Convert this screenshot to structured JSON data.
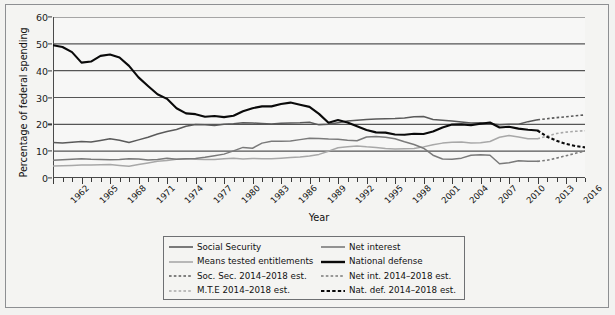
{
  "chart_data": {
    "type": "line",
    "title": "",
    "xlabel": "Year",
    "ylabel": "Percentage of federal spending",
    "xlim": [
      1962,
      2018
    ],
    "ylim": [
      0,
      60
    ],
    "ytick_values": [
      0,
      10,
      20,
      30,
      40,
      50,
      60
    ],
    "ytick_labels": [
      "0",
      "10",
      "20",
      "30",
      "40",
      "50",
      "60"
    ],
    "xtick_labels": [
      "1962",
      "1965",
      "1968",
      "1971",
      "1974",
      "1977",
      "1980",
      "1983",
      "1986",
      "1989",
      "1992",
      "1995",
      "1998",
      "2001",
      "2004",
      "2007",
      "2010",
      "2013",
      "2016"
    ],
    "xtick_values": [
      1962,
      1965,
      1968,
      1971,
      1974,
      1977,
      1980,
      1983,
      1986,
      1989,
      1992,
      1995,
      1998,
      2001,
      2004,
      2007,
      2010,
      2013,
      2016
    ],
    "x_minor_step": 1,
    "grid": "horizontal",
    "legend_position": "below-center",
    "x": [
      1962,
      1963,
      1964,
      1965,
      1966,
      1967,
      1968,
      1969,
      1970,
      1971,
      1972,
      1973,
      1974,
      1975,
      1976,
      1977,
      1978,
      1979,
      1980,
      1981,
      1982,
      1983,
      1984,
      1985,
      1986,
      1987,
      1988,
      1989,
      1990,
      1991,
      1992,
      1993,
      1994,
      1995,
      1996,
      1997,
      1998,
      1999,
      2000,
      2001,
      2002,
      2003,
      2004,
      2005,
      2006,
      2007,
      2008,
      2009,
      2010,
      2011,
      2012,
      2013
    ],
    "x_est": [
      2013,
      2014,
      2015,
      2016,
      2017,
      2018
    ],
    "series": [
      {
        "name": "Social Security",
        "color": "#5a5a5a",
        "style": "solid",
        "width": 1.5,
        "values": [
          13.2,
          13.0,
          13.3,
          13.6,
          13.4,
          14.0,
          14.6,
          14.1,
          13.2,
          14.2,
          15.2,
          16.4,
          17.3,
          18.1,
          19.3,
          19.9,
          19.8,
          19.6,
          20.0,
          20.2,
          20.6,
          20.5,
          20.3,
          20.1,
          20.4,
          20.5,
          20.6,
          20.8,
          19.8,
          20.0,
          20.6,
          21.2,
          21.5,
          21.8,
          22.0,
          22.1,
          22.2,
          22.4,
          22.8,
          22.9,
          21.8,
          21.5,
          21.2,
          20.9,
          20.5,
          20.6,
          20.2,
          19.8,
          20.0,
          20.0,
          21.0,
          21.7
        ]
      },
      {
        "name": "Means tested entitlements",
        "color": "#a8a8a8",
        "style": "solid",
        "width": 1.5,
        "values": [
          4.5,
          4.6,
          4.7,
          4.8,
          4.8,
          4.9,
          5.0,
          4.7,
          4.4,
          5.0,
          5.6,
          6.2,
          6.5,
          7.0,
          7.2,
          7.0,
          6.9,
          6.9,
          7.2,
          7.4,
          7.1,
          7.3,
          7.2,
          7.2,
          7.4,
          7.6,
          7.8,
          8.2,
          8.8,
          10.0,
          11.3,
          11.6,
          11.9,
          11.6,
          11.4,
          11.0,
          10.8,
          10.9,
          11.0,
          11.6,
          12.4,
          13.0,
          13.3,
          13.4,
          13.0,
          13.1,
          13.6,
          15.2,
          15.8,
          15.3,
          14.6,
          14.6
        ]
      },
      {
        "name": "Net interest",
        "color": "#7a7a7a",
        "style": "solid",
        "width": 1.5,
        "values": [
          6.6,
          6.8,
          7.0,
          7.2,
          7.0,
          6.9,
          6.8,
          6.9,
          7.2,
          7.1,
          6.7,
          6.9,
          7.4,
          7.0,
          7.2,
          7.3,
          7.7,
          8.3,
          8.9,
          10.1,
          11.4,
          11.1,
          13.0,
          13.7,
          13.7,
          13.8,
          14.3,
          14.8,
          14.7,
          14.5,
          14.4,
          14.1,
          13.9,
          15.3,
          15.5,
          15.2,
          14.6,
          13.5,
          12.5,
          11.1,
          8.5,
          7.1,
          7.0,
          7.4,
          8.5,
          8.7,
          8.5,
          5.3,
          5.7,
          6.4,
          6.2,
          6.2
        ]
      },
      {
        "name": "National defense",
        "color": "#0a0a0a",
        "style": "solid",
        "width": 2.1,
        "values": [
          49.5,
          48.8,
          46.9,
          43.0,
          43.4,
          45.5,
          46.0,
          44.9,
          41.8,
          37.5,
          34.3,
          31.2,
          29.5,
          26.0,
          24.1,
          23.8,
          22.8,
          23.1,
          22.7,
          23.2,
          24.9,
          26.0,
          26.7,
          26.7,
          27.6,
          28.1,
          27.3,
          26.5,
          23.9,
          20.6,
          21.6,
          20.7,
          19.3,
          17.9,
          17.0,
          16.9,
          16.2,
          16.1,
          16.5,
          16.4,
          17.3,
          18.8,
          19.9,
          20.0,
          19.7,
          20.2,
          20.7,
          18.8,
          19.1,
          18.4,
          18.0,
          17.7
        ]
      }
    ],
    "series_est": [
      {
        "name": "Soc. Sec. 2014–2018 est.",
        "color": "#5a5a5a",
        "style": "dashed",
        "width": 1.6,
        "values": [
          21.7,
          22.1,
          22.5,
          22.8,
          23.2,
          23.5
        ]
      },
      {
        "name": "M.T.E 2014–2018 est.",
        "color": "#a8a8a8",
        "style": "dashed",
        "width": 1.6,
        "values": [
          14.6,
          15.6,
          16.6,
          17.1,
          17.4,
          17.6
        ]
      },
      {
        "name": "Net int. 2014–2018 est.",
        "color": "#7a7a7a",
        "style": "dashed",
        "width": 1.6,
        "values": [
          6.2,
          6.6,
          7.4,
          8.3,
          9.2,
          10.1
        ]
      },
      {
        "name": "Nat. def. 2014–2018 est.",
        "color": "#0a0a0a",
        "style": "dashed",
        "width": 2.1,
        "values": [
          17.7,
          15.4,
          13.9,
          12.7,
          11.9,
          11.4
        ]
      }
    ]
  },
  "legend": {
    "rows": [
      {
        "left": {
          "label": "Social Security",
          "color": "#5a5a5a",
          "style": "solid",
          "width": 1.6
        },
        "right": {
          "label": "Net interest",
          "color": "#7a7a7a",
          "style": "solid",
          "width": 1.6
        }
      },
      {
        "left": {
          "label": "Means tested entitlements",
          "color": "#a8a8a8",
          "style": "solid",
          "width": 1.6
        },
        "right": {
          "label": "National defense",
          "color": "#0a0a0a",
          "style": "solid",
          "width": 2.4
        }
      },
      {
        "left": {
          "label": "Soc. Sec. 2014–2018 est.",
          "color": "#5a5a5a",
          "style": "dashed",
          "width": 1.6
        },
        "right": {
          "label": "Net int. 2014–2018 est.",
          "color": "#7a7a7a",
          "style": "dashed",
          "width": 1.6
        }
      },
      {
        "left": {
          "label": "M.T.E 2014–2018 est.",
          "color": "#a8a8a8",
          "style": "dashed",
          "width": 1.6
        },
        "right": {
          "label": "Nat. def. 2014–2018 est.",
          "color": "#0a0a0a",
          "style": "dashed",
          "width": 2.2
        }
      }
    ]
  },
  "colors": {
    "figure_background": "#f2f2f0",
    "plot_background": "#f7f7f6",
    "frame": "#8d8f92",
    "gridline": "#555555",
    "axis": "#4a4a4a",
    "text": "#111111"
  }
}
